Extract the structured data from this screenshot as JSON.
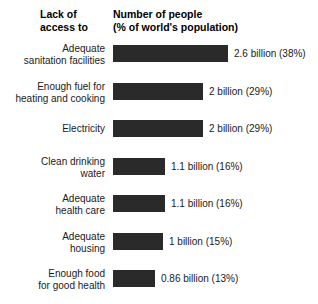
{
  "header": {
    "left_title": "Lack of\naccess to",
    "right_title": "Number of people\n(% of world's population)"
  },
  "style": {
    "bar_color": "#2a2a2a",
    "background": "#ffffff",
    "text_color": "#1a1a1a"
  },
  "chart_data": {
    "type": "bar",
    "orientation": "horizontal",
    "title": "Number of people (% of world's population)",
    "xlabel": "",
    "ylabel": "Lack of access to",
    "grid": false,
    "legend": null,
    "xlim": [
      0,
      2.6
    ],
    "unit": "billion people",
    "categories": [
      "Adequate\nsanitation facilities",
      "Enough fuel for\nheating and cooking",
      "Electricity",
      "Clean drinking\nwater",
      "Adequate\nhealth care",
      "Adequate\nhousing",
      "Enough food\nfor good health"
    ],
    "values": [
      2.6,
      2,
      2,
      1.1,
      1.1,
      1,
      0.86
    ],
    "percentages": [
      38,
      29,
      29,
      16,
      16,
      15,
      13
    ],
    "data_labels": [
      "2.6 billion (38%)",
      "2 billion (29%)",
      "2 billion (29%)",
      "1.1 billion (16%)",
      "1.1 billion (16%)",
      "1 billion (15%)",
      "0.86 billion (13%)"
    ]
  },
  "rows": [
    {
      "label": "Adequate\nsanitation facilities",
      "value_label": "2.6 billion (38%)",
      "bar_width": 115,
      "top": 45
    },
    {
      "label": "Enough fuel for\nheating and cooking",
      "value_label": "2 billion (29%)",
      "bar_width": 90,
      "top": 83
    },
    {
      "label": "Electricity",
      "value_label": "2 billion (29%)",
      "bar_width": 90,
      "top": 120
    },
    {
      "label": "Clean drinking\nwater",
      "value_label": "1.1 billion (16%)",
      "bar_width": 52,
      "top": 158
    },
    {
      "label": "Adequate\nhealth care",
      "value_label": "1.1 billion (16%)",
      "bar_width": 52,
      "top": 195
    },
    {
      "label": "Adequate\nhousing",
      "value_label": "1 billion (15%)",
      "bar_width": 50,
      "top": 233
    },
    {
      "label": "Enough food\nfor good health",
      "value_label": "0.86 billion (13%)",
      "bar_width": 42,
      "top": 270
    }
  ]
}
